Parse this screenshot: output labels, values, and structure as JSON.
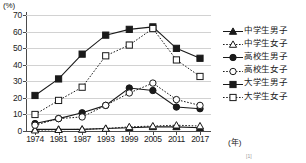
{
  "chart_data": {
    "type": "line",
    "title": "",
    "xlabel": "(年)",
    "ylabel": "(%)",
    "x": [
      1974,
      1981,
      1987,
      1993,
      1999,
      2005,
      2011,
      2017
    ],
    "xtick_labels": [
      "1974",
      "1981",
      "1987",
      "1993",
      "1999",
      "2005",
      "2011",
      "2017"
    ],
    "ytick_labels": [
      "0",
      "10",
      "20",
      "30",
      "40",
      "50",
      "60",
      "70"
    ],
    "ytick_values": [
      0,
      10,
      20,
      30,
      40,
      50,
      60,
      70
    ],
    "ylim": [
      0,
      72
    ],
    "grid": true,
    "legend_position": "right",
    "series": [
      {
        "name": "中学生男子",
        "marker": "filled-triangle",
        "line": "solid",
        "color": "#1a1a1a",
        "values": [
          1.0,
          1.0,
          1.0,
          1.5,
          2.0,
          2.5,
          2.5,
          2.0
        ]
      },
      {
        "name": "中学生女子",
        "marker": "open-triangle",
        "line": "dotted",
        "color": "#1a1a1a",
        "values": [
          0.5,
          0.8,
          1.0,
          1.5,
          2.5,
          3.0,
          3.5,
          3.0
        ]
      },
      {
        "name": "高校生男子",
        "marker": "filled-circle",
        "line": "solid",
        "color": "#1a1a1a",
        "values": [
          4.5,
          7.5,
          11.0,
          15.5,
          26.0,
          24.5,
          14.5,
          13.5
        ]
      },
      {
        "name": "高校生女子",
        "marker": "open-circle",
        "line": "dotted",
        "color": "#1a1a1a",
        "values": [
          3.5,
          7.5,
          8.5,
          15.5,
          23.0,
          29.0,
          19.0,
          15.5
        ]
      },
      {
        "name": "大学生男子",
        "marker": "filled-square",
        "line": "solid",
        "color": "#1a1a1a",
        "values": [
          21.5,
          31.5,
          46.5,
          58.0,
          61.5,
          63.0,
          50.0,
          44.0
        ]
      },
      {
        "name": "大学生女子",
        "marker": "open-square",
        "line": "dotted",
        "color": "#1a1a1a",
        "values": [
          10.0,
          18.5,
          26.5,
          45.5,
          52.0,
          62.0,
          43.0,
          33.0
        ]
      }
    ]
  }
}
